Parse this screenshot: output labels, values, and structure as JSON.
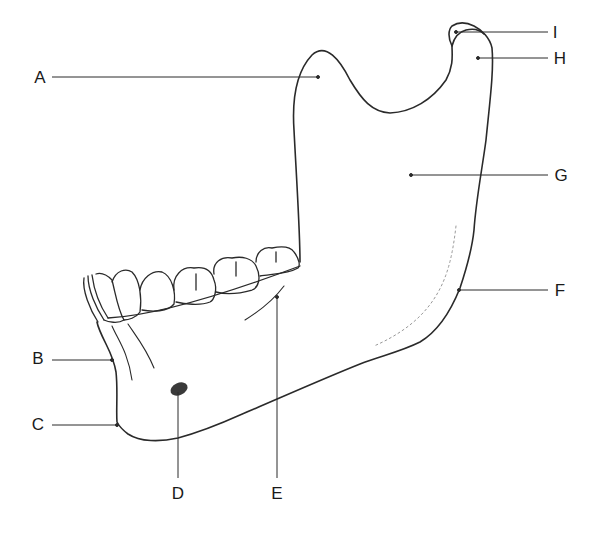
{
  "diagram": {
    "line_color": "#2a2a2a",
    "foramen_color": "#3a3a3a",
    "labels": [
      {
        "id": "A",
        "text": "A",
        "x": 40,
        "y": 77
      },
      {
        "id": "B",
        "text": "B",
        "x": 38,
        "y": 356
      },
      {
        "id": "C",
        "text": "C",
        "x": 38,
        "y": 424
      },
      {
        "id": "D",
        "text": "D",
        "x": 178,
        "y": 493
      },
      {
        "id": "E",
        "text": "E",
        "x": 277,
        "y": 493
      },
      {
        "id": "F",
        "text": "F",
        "x": 560,
        "y": 290
      },
      {
        "id": "G",
        "text": "G",
        "x": 561,
        "y": 175
      },
      {
        "id": "H",
        "text": "H",
        "x": 560,
        "y": 57
      },
      {
        "id": "I",
        "text": "I",
        "x": 555,
        "y": 32
      }
    ]
  }
}
